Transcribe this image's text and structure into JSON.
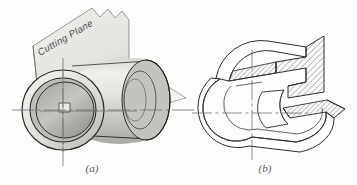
{
  "figure": {
    "kind": "engineering-drawing",
    "background_color": "#fdfdfc",
    "ink_color": "#2b2b2d",
    "centerline_color": "#6f7075",
    "hatch_color": "#3a3a3c",
    "plane_fill": "#e9e9e6",
    "shade_light": "#efefec",
    "shade_mid": "#cfcfcb",
    "shade_dark": "#9a9a96"
  },
  "panels": [
    {
      "id": "panel-a",
      "caption": "(a)",
      "caption_x": 92,
      "caption_y": 172,
      "subject": "hollow cylinder with cutting plane",
      "annotation": {
        "label": "Cutting Plane",
        "rotation_deg": -27
      }
    },
    {
      "id": "panel-b",
      "caption": "(b)",
      "caption_x": 265,
      "caption_y": 172,
      "subject": "cut section of the cylinder with section hatching"
    }
  ],
  "labels": {
    "cutting_plane": "Cutting Plane",
    "caption_a": "(a)",
    "caption_b": "(b)"
  }
}
